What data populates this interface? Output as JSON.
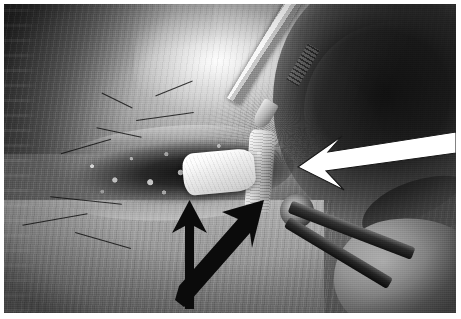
{
  "figure": {
    "kind": "clinical-photograph",
    "modality": "grayscale intraoperative photograph",
    "alt_text": "Black and white intraoperative surgical photograph of an open incision with a bright white specimen in the wound bed, marked by annotation arrows.",
    "caption": "",
    "plate_border_color": "#ffffff",
    "image_background_color": "#6a6a6a"
  },
  "page": {
    "background_color": "#ffffff",
    "margins": {
      "left_px": 4,
      "top_px": 4,
      "right_px": 5,
      "bottom_px": 6
    }
  },
  "scene": {
    "regions": [
      {
        "id": "upper-left-shadow",
        "label": "shadowed body contour",
        "tone": "dark"
      },
      {
        "id": "highlight-ridge",
        "label": "specular skin highlight",
        "tone": "bright"
      },
      {
        "id": "wound-cavity",
        "label": "open surgical incision",
        "tone": "dark"
      },
      {
        "id": "specimen-mass",
        "label": "white specimen in wound bed",
        "tone": "white"
      },
      {
        "id": "fibrous-column",
        "label": "pale fibrous strand",
        "tone": "light"
      },
      {
        "id": "dark-right-mass",
        "label": "shadowed tissue bulk",
        "tone": "very dark"
      },
      {
        "id": "lower-skin",
        "label": "skin surface below incision",
        "tone": "mid"
      },
      {
        "id": "lower-right-tissue",
        "label": "tissue at lower right",
        "tone": "mid"
      }
    ],
    "instruments": [
      {
        "id": "forceps-upper",
        "label": "surgical forceps shaft",
        "position": "upper right, angled down-left"
      },
      {
        "id": "retractor-limb-a",
        "label": "retractor limb",
        "position": "lower right, angled down-right"
      },
      {
        "id": "retractor-limb-b",
        "label": "second retractor limb",
        "position": "lower right, steeper angle"
      }
    ],
    "ghost_text": {
      "present": true,
      "location": "left edge",
      "legible": false,
      "description": "faint bleed-through of printed text from the facing page"
    }
  },
  "annotations": {
    "arrows": [
      {
        "id": "white-arrow",
        "color": "#ffffff",
        "outline_color": "#2a2a2a",
        "direction": "points left and slightly down",
        "target": "specimen-mass",
        "tail": {
          "x": 452,
          "y": 138
        },
        "head": {
          "x": 298,
          "y": 161
        },
        "head_width": 34,
        "shaft_width": 11
      },
      {
        "id": "black-arrow-vertical",
        "color": "#111111",
        "direction": "points up",
        "target": "wound-cavity-lower-margin",
        "tail": {
          "x": 185,
          "y": 299
        },
        "head": {
          "x": 185,
          "y": 213
        },
        "head_width": 33,
        "shaft_width": 9
      },
      {
        "id": "black-arrow-diagonal",
        "color": "#111111",
        "direction": "points up and to the right",
        "target": "wound-cavity-right-margin",
        "tail": {
          "x": 185,
          "y": 299
        },
        "head": {
          "x": 258,
          "y": 212
        },
        "head_width": 32,
        "shaft_width": 9
      }
    ],
    "labels": [],
    "scale_bar": null,
    "figure_number": null
  }
}
